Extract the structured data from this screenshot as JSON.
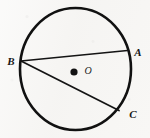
{
  "figure": {
    "type": "circle-geometry-diagram",
    "background_color": "#f6f5f3",
    "stroke_color": "#111111",
    "canvas": {
      "width": 150,
      "height": 138
    },
    "circle": {
      "name": "circle-O",
      "center": {
        "x": 75.5,
        "y": 69
      },
      "radius_x": 55.5,
      "radius_y": 61,
      "stroke_width": 2.6
    },
    "center_point": {
      "label": "O",
      "dot": {
        "x": 74,
        "y": 72,
        "r": 3.6
      },
      "label_position": {
        "x": 88,
        "y": 71
      }
    },
    "points": [
      {
        "id": "A",
        "label": "A",
        "x": 127,
        "y": 50.5,
        "label_position": {
          "x": 138,
          "y": 52
        }
      },
      {
        "id": "B",
        "label": "B",
        "x": 21,
        "y": 61,
        "label_position": {
          "x": 11,
          "y": 61
        }
      },
      {
        "id": "C",
        "label": "C",
        "x": 118.5,
        "y": 110,
        "label_position": {
          "x": 133,
          "y": 114
        }
      }
    ],
    "chords": [
      {
        "id": "BA",
        "from": "B",
        "to": "A",
        "stroke_width": 1.7
      },
      {
        "id": "BC",
        "from": "B",
        "to": "C",
        "stroke_width": 1.7
      }
    ]
  }
}
